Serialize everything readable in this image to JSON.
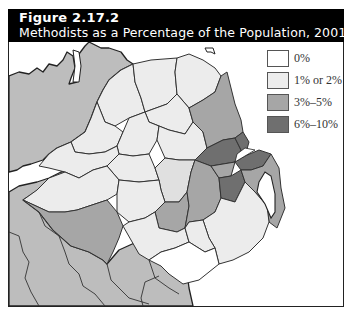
{
  "figure": {
    "number": "Figure 2.17.2",
    "title": "Methodists as a Percentage of the Population, 2001"
  },
  "legend": {
    "items": [
      {
        "label": "0%",
        "color": "#ffffff"
      },
      {
        "label": "1% or 2%",
        "color": "#ececec"
      },
      {
        "label": "3%–5%",
        "color": "#a6a6a6"
      },
      {
        "label": "6%–10%",
        "color": "#6f6f6f"
      }
    ]
  },
  "map": {
    "subject": "Northern Ireland districts",
    "surrounding_land_color": "#bdbdbd",
    "sea_color": "#ffffff",
    "border_color": "#333333"
  }
}
